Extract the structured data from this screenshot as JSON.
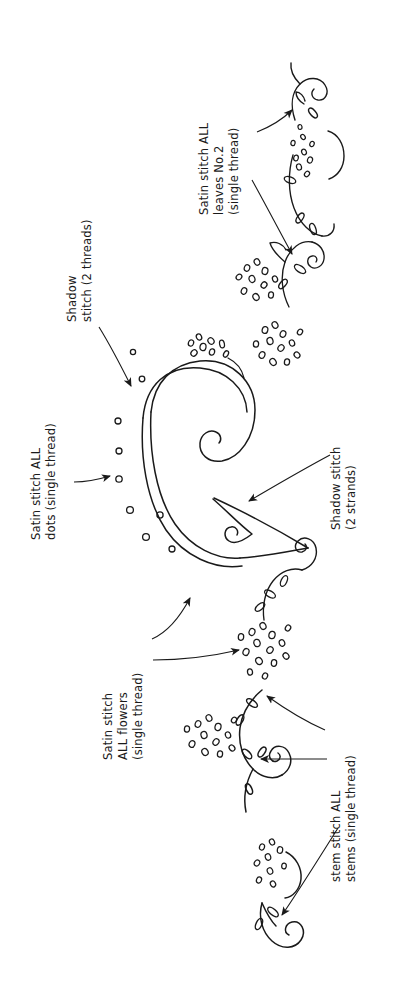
{
  "document": {
    "kind": "hand-drawn embroidery pattern diagram",
    "title": "Embroidery Stitch Guide",
    "orientation": "labels rotated 90 degrees counter-clockwise",
    "background_color": "#ffffff",
    "ink_color": "#1a1a1a"
  },
  "annotations": [
    {
      "id": "satin-stitch-dots",
      "lines": [
        "Satin stitch ALL",
        "dots (single thread)"
      ],
      "line1": "Satin stitch ALL",
      "line2": "dots (single thread)",
      "full_text": "Satin stitch ALL dots (single thread)",
      "position": "left edge, lower-middle",
      "rotation_deg": -90,
      "arrows": 1
    },
    {
      "id": "shadow-stitch-2-threads",
      "lines": [
        "Shadow",
        "stitch  (2 threads)"
      ],
      "line1": "Shadow",
      "line2": "stitch  (2 threads)",
      "full_text": "Shadow stitch (2 threads)",
      "position": "left-upper, points to main scroll",
      "rotation_deg": -90,
      "arrows": 1
    },
    {
      "id": "satin-stitch-leaves-no2",
      "lines": [
        "Satin stitch ALL",
        "leaves No.2",
        "(single thread)"
      ],
      "line1": "Satin stitch ALL",
      "line2": "leaves No.2",
      "line3": "(single thread)",
      "full_text": "Satin stitch ALL leaves No.2 (single thread)",
      "position": "top-right",
      "rotation_deg": -90,
      "arrows": 2
    },
    {
      "id": "shadow-stitch-2-strands",
      "lines": [
        "Shadow stitch",
        "(2 strands)"
      ],
      "line1": "Shadow stitch",
      "line2": "(2 strands)",
      "full_text": "Shadow stitch (2 strands)",
      "position": "right-middle",
      "rotation_deg": -90,
      "arrows": 1
    },
    {
      "id": "satin-stitch-flowers",
      "lines": [
        "Satin stitch",
        "ALL flowers",
        "(single thread)"
      ],
      "line1": "Satin stitch",
      "line2": "ALL flowers",
      "line3": "(single thread)",
      "full_text": "Satin stitch ALL flowers (single thread)",
      "position": "left-lower",
      "rotation_deg": -90,
      "arrows": 2
    },
    {
      "id": "stem-stitch-stems",
      "lines": [
        "stem stitch ALL",
        "stems (single thread)"
      ],
      "line1": "stem stitch ALL",
      "line2": "stems (single thread)",
      "full_text": "stem stitch ALL stems (single thread)",
      "position": "right-lower",
      "rotation_deg": -90,
      "arrows": 3
    }
  ],
  "motifs": {
    "main_scroll": "large central double-line C-shaped scroll with spiral terminals",
    "flower_clusters": 6,
    "leaf_sprigs": 7,
    "satin_dots": 9,
    "small_spirals": 4
  }
}
